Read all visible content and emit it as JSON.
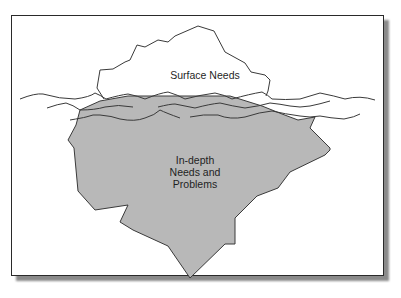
{
  "diagram": {
    "type": "iceberg-metaphor",
    "labels": {
      "surface": "Surface Needs",
      "depth_line1": "In-depth",
      "depth_line2": "Needs and",
      "depth_line3": "Problems"
    },
    "colors": {
      "underwater_fill": "#b8b8b8",
      "outline": "#3a3a3a",
      "frame_border": "#2a2a2a",
      "shadow": "#8a8a8a",
      "background": "#ffffff"
    }
  }
}
